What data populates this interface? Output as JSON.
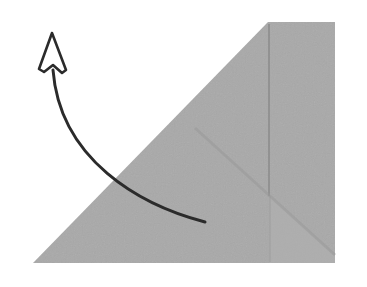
{
  "diagram": {
    "type": "origami-fold-instruction",
    "background": "#ffffff",
    "paper": {
      "shape": "pentagon (right-triangle-like with truncated top)",
      "fill": "#a9a9a9",
      "crease_color": "#8f8f8f",
      "points": "33,263 268,22 335,22 335,263"
    },
    "arrow": {
      "meaning": "fold up / lift flap",
      "stroke": "#2b2b2b",
      "head": "hollow"
    }
  }
}
